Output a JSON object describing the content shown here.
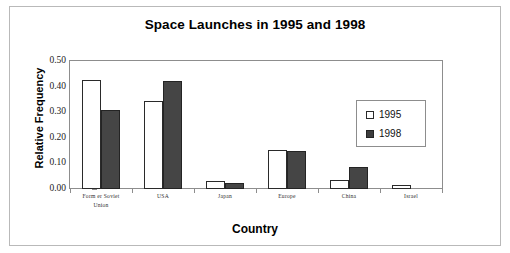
{
  "chart_data": {
    "type": "bar",
    "title": "Space Launches in 1995 and 1998",
    "xlabel": "Country",
    "ylabel": "Relative Frequency",
    "categories": [
      "Form er Soviet Union",
      "USA",
      "Japan",
      "Europe",
      "China",
      "Israel"
    ],
    "category_lines": [
      [
        "Form er Soviet",
        "Union"
      ],
      [
        "USA"
      ],
      [
        "Japan"
      ],
      [
        "Europe"
      ],
      [
        "China"
      ],
      [
        "Israel"
      ]
    ],
    "series": [
      {
        "name": "1995",
        "values": [
          0.425,
          0.345,
          0.03,
          0.152,
          0.035,
          0.015
        ],
        "color": "#ffffff"
      },
      {
        "name": "1998",
        "values": [
          0.31,
          0.42,
          0.025,
          0.148,
          0.085,
          0.0
        ],
        "color": "#454545"
      }
    ],
    "ylim": [
      0.0,
      0.5
    ],
    "yticks": [
      "0.00",
      "0.10",
      "0.20",
      "0.30",
      "0.40",
      "0.50"
    ],
    "ytick_values": [
      0.0,
      0.1,
      0.2,
      0.3,
      0.4,
      0.5
    ],
    "grid": false,
    "legend_position": "inside-right"
  },
  "legend": {
    "entries": [
      {
        "label": "1995"
      },
      {
        "label": "1998"
      }
    ]
  }
}
